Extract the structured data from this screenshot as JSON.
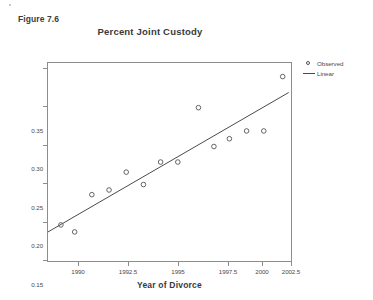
{
  "figure": {
    "label": "Figure 7.6"
  },
  "chart_data": {
    "type": "scatter",
    "title": "Percent Joint Custody",
    "xlabel": "Year of Divorce",
    "ylabel": "",
    "xlim": [
      1988.45,
      2002.7
    ],
    "ylim": [
      0.1,
      0.3575
    ],
    "grid": false,
    "legend_position": "right",
    "xticks": [
      1990,
      1992.5,
      1995,
      1997.5,
      2000,
      2002.5
    ],
    "xtick_labels": [
      "1990",
      "1992.5",
      "1995",
      "1997.5",
      "2000",
      "2002.5"
    ],
    "yticks": [
      0.1,
      0.15,
      0.2,
      0.25,
      0.3,
      0.35
    ],
    "ytick_labels": [
      "0.10",
      "0.15",
      "0.20",
      "0.25",
      "0.30",
      "0.35"
    ],
    "series": [
      {
        "name": "Observed",
        "type": "scatter",
        "marker": "open-circle",
        "color": "#555558",
        "points": [
          {
            "x": 1989.2,
            "y": 0.149
          },
          {
            "x": 1990.0,
            "y": 0.14
          },
          {
            "x": 1991.0,
            "y": 0.188
          },
          {
            "x": 1992.0,
            "y": 0.194
          },
          {
            "x": 1993.0,
            "y": 0.217
          },
          {
            "x": 1994.0,
            "y": 0.201
          },
          {
            "x": 1995.0,
            "y": 0.23
          },
          {
            "x": 1996.0,
            "y": 0.23
          },
          {
            "x": 1997.2,
            "y": 0.3
          },
          {
            "x": 1998.1,
            "y": 0.25
          },
          {
            "x": 1999.0,
            "y": 0.26
          },
          {
            "x": 2000.0,
            "y": 0.27
          },
          {
            "x": 2001.0,
            "y": 0.27
          },
          {
            "x": 2002.1,
            "y": 0.34
          }
        ]
      },
      {
        "name": "Linear",
        "type": "line",
        "color": "#4a4a4d",
        "endpoints": [
          {
            "x": 1988.45,
            "y": 0.14
          },
          {
            "x": 2002.45,
            "y": 0.3195
          }
        ]
      }
    ]
  },
  "legend": {
    "entries": [
      {
        "label": "Observed",
        "key": "open-circle"
      },
      {
        "label": "Linear",
        "key": "line"
      }
    ]
  }
}
